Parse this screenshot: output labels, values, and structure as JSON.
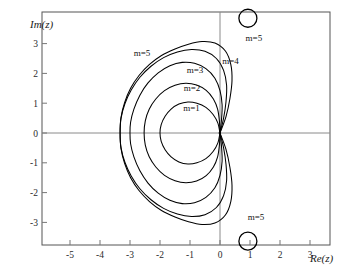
{
  "figure": {
    "title": "",
    "background_color": "#ffffff",
    "curve_color": "#000000",
    "axis_color": "#8a8a8a",
    "frame_color": "#555555"
  },
  "axes": {
    "x_label": "Re(z)",
    "y_label": "Im(z)",
    "x_ticks": [
      "-5",
      "-4",
      "-3",
      "-2",
      "-1",
      "0",
      "1",
      "2",
      "3"
    ],
    "y_ticks": [
      "3",
      "2",
      "1",
      "0",
      "-1",
      "-2",
      "-3"
    ]
  },
  "annotations": {
    "m1": "m=1",
    "m2": "m=2",
    "m3": "m=3",
    "m4": "m=4",
    "m5": "m=5",
    "m5_top_circle": "m=5",
    "m5_bottom_circle": "m=5"
  },
  "chart_data": {
    "type": "line",
    "title": "",
    "xlabel": "Re(z)",
    "ylabel": "Im(z)",
    "xlim": [
      -5.93,
      3.67
    ],
    "ylim": [
      -4.07,
      3.77
    ],
    "grid": false,
    "legend": "inline-labels",
    "x_tick_values": [
      -5,
      -4,
      -3,
      -2,
      -1,
      0,
      1,
      2,
      3
    ],
    "y_tick_values": [
      3,
      2,
      1,
      0,
      -1,
      -2,
      -3
    ],
    "series": [
      {
        "name": "m=1",
        "label": "m=1",
        "label_at": [
          -0.95,
          0.73
        ],
        "closed": true,
        "real_axis_crossings": [
          -2.0,
          0.0
        ],
        "extent_x": [
          -2.0,
          0.03
        ],
        "extent_y": [
          -1.04,
          1.04
        ],
        "points": [
          [
            0.0,
            0.0
          ],
          [
            -0.07,
            0.33
          ],
          [
            -0.23,
            0.62
          ],
          [
            -0.47,
            0.86
          ],
          [
            -0.77,
            1.0
          ],
          [
            -1.07,
            1.04
          ],
          [
            -1.37,
            0.97
          ],
          [
            -1.63,
            0.8
          ],
          [
            -1.83,
            0.56
          ],
          [
            -1.96,
            0.28
          ],
          [
            -2.0,
            0.0
          ],
          [
            -1.96,
            -0.28
          ],
          [
            -1.83,
            -0.56
          ],
          [
            -1.63,
            -0.8
          ],
          [
            -1.37,
            -0.97
          ],
          [
            -1.07,
            -1.04
          ],
          [
            -0.77,
            -1.0
          ],
          [
            -0.47,
            -0.86
          ],
          [
            -0.23,
            -0.62
          ],
          [
            -0.07,
            -0.33
          ],
          [
            0.0,
            0.0
          ]
        ]
      },
      {
        "name": "m=2",
        "label": "m=2",
        "label_at": [
          -0.93,
          1.4
        ],
        "closed": true,
        "real_axis_crossings": [
          -2.53,
          0.0
        ],
        "extent_x": [
          -2.53,
          0.06
        ],
        "extent_y": [
          -1.67,
          1.67
        ],
        "points": [
          [
            0.0,
            0.0
          ],
          [
            -0.02,
            0.4
          ],
          [
            -0.08,
            0.8
          ],
          [
            -0.22,
            1.14
          ],
          [
            -0.46,
            1.43
          ],
          [
            -0.78,
            1.61
          ],
          [
            -1.14,
            1.67
          ],
          [
            -1.5,
            1.6
          ],
          [
            -1.85,
            1.42
          ],
          [
            -2.14,
            1.14
          ],
          [
            -2.36,
            0.8
          ],
          [
            -2.49,
            0.41
          ],
          [
            -2.53,
            0.0
          ],
          [
            -2.49,
            -0.41
          ],
          [
            -2.36,
            -0.8
          ],
          [
            -2.14,
            -1.14
          ],
          [
            -1.85,
            -1.42
          ],
          [
            -1.5,
            -1.6
          ],
          [
            -1.14,
            -1.67
          ],
          [
            -0.78,
            -1.61
          ],
          [
            -0.46,
            -1.43
          ],
          [
            -0.22,
            -1.14
          ],
          [
            -0.08,
            -0.8
          ],
          [
            -0.02,
            -0.4
          ],
          [
            0.0,
            0.0
          ]
        ]
      },
      {
        "name": "m=3",
        "label": "m=3",
        "label_at": [
          -0.83,
          2.0
        ],
        "closed": true,
        "real_axis_crossings": [
          -3.0,
          0.0
        ],
        "extent_x": [
          -3.0,
          0.1
        ],
        "extent_y": [
          -2.37,
          2.37
        ],
        "points": [
          [
            0.0,
            0.0
          ],
          [
            0.05,
            0.45
          ],
          [
            0.07,
            0.95
          ],
          [
            0.0,
            1.42
          ],
          [
            -0.17,
            1.84
          ],
          [
            -0.47,
            2.16
          ],
          [
            -0.85,
            2.34
          ],
          [
            -1.26,
            2.37
          ],
          [
            -1.67,
            2.26
          ],
          [
            -2.06,
            2.02
          ],
          [
            -2.4,
            1.68
          ],
          [
            -2.67,
            1.27
          ],
          [
            -2.87,
            0.8
          ],
          [
            -2.98,
            0.36
          ],
          [
            -3.0,
            0.0
          ],
          [
            -2.98,
            -0.36
          ],
          [
            -2.87,
            -0.8
          ],
          [
            -2.67,
            -1.27
          ],
          [
            -2.4,
            -1.68
          ],
          [
            -2.06,
            -2.02
          ],
          [
            -1.67,
            -2.26
          ],
          [
            -1.26,
            -2.37
          ],
          [
            -0.85,
            -2.34
          ],
          [
            -0.47,
            -2.16
          ],
          [
            -0.17,
            -1.84
          ],
          [
            0.0,
            -1.42
          ],
          [
            0.07,
            -0.95
          ],
          [
            0.05,
            -0.45
          ],
          [
            0.0,
            0.0
          ]
        ]
      },
      {
        "name": "m=4",
        "label": "m=4",
        "label_at": [
          0.35,
          2.3
        ],
        "closed": true,
        "real_axis_crossings": [
          -3.33,
          0.0
        ],
        "extent_x": [
          -3.33,
          0.22
        ],
        "extent_y": [
          -2.8,
          2.8
        ],
        "points": [
          [
            0.0,
            0.0
          ],
          [
            0.12,
            0.5
          ],
          [
            0.2,
            1.05
          ],
          [
            0.22,
            1.6
          ],
          [
            0.12,
            2.1
          ],
          [
            -0.12,
            2.5
          ],
          [
            -0.5,
            2.74
          ],
          [
            -0.95,
            2.8
          ],
          [
            -1.42,
            2.72
          ],
          [
            -1.88,
            2.53
          ],
          [
            -2.3,
            2.24
          ],
          [
            -2.67,
            1.87
          ],
          [
            -2.96,
            1.44
          ],
          [
            -3.17,
            0.98
          ],
          [
            -3.3,
            0.49
          ],
          [
            -3.33,
            0.0
          ],
          [
            -3.3,
            -0.49
          ],
          [
            -3.17,
            -0.98
          ],
          [
            -2.96,
            -1.44
          ],
          [
            -2.67,
            -1.87
          ],
          [
            -2.3,
            -2.24
          ],
          [
            -1.88,
            -2.53
          ],
          [
            -1.42,
            -2.72
          ],
          [
            -0.95,
            -2.8
          ],
          [
            -0.5,
            -2.74
          ],
          [
            -0.12,
            -2.5
          ],
          [
            0.12,
            -2.1
          ],
          [
            0.22,
            -1.6
          ],
          [
            0.2,
            -1.05
          ],
          [
            0.12,
            -0.5
          ],
          [
            0.0,
            0.0
          ]
        ]
      },
      {
        "name": "m=5",
        "label": "m=5",
        "label_at": [
          -2.6,
          2.6
        ],
        "closed": true,
        "real_axis_crossings": [
          -3.33,
          0.0
        ],
        "extent_x": [
          -3.33,
          0.4
        ],
        "extent_y": [
          -3.07,
          3.07
        ],
        "points": [
          [
            0.0,
            0.0
          ],
          [
            0.2,
            0.55
          ],
          [
            0.33,
            1.15
          ],
          [
            0.4,
            1.75
          ],
          [
            0.36,
            2.3
          ],
          [
            0.18,
            2.75
          ],
          [
            -0.17,
            3.02
          ],
          [
            -0.6,
            3.07
          ],
          [
            -1.05,
            2.98
          ],
          [
            -1.5,
            2.82
          ],
          [
            -1.95,
            2.6
          ],
          [
            -2.35,
            2.3
          ],
          [
            -2.7,
            1.93
          ],
          [
            -2.98,
            1.5
          ],
          [
            -3.18,
            1.02
          ],
          [
            -3.3,
            0.52
          ],
          [
            -3.33,
            0.0
          ],
          [
            -3.3,
            -0.52
          ],
          [
            -3.18,
            -1.02
          ],
          [
            -2.98,
            -1.5
          ],
          [
            -2.7,
            -1.93
          ],
          [
            -2.35,
            -2.3
          ],
          [
            -1.95,
            -2.6
          ],
          [
            -1.5,
            -2.82
          ],
          [
            -1.05,
            -2.98
          ],
          [
            -0.6,
            -3.07
          ],
          [
            -0.17,
            -3.02
          ],
          [
            0.18,
            -2.75
          ],
          [
            0.36,
            -2.3
          ],
          [
            0.4,
            -1.75
          ],
          [
            0.33,
            -1.15
          ],
          [
            0.2,
            -0.55
          ],
          [
            0.0,
            0.0
          ]
        ]
      }
    ],
    "isolated_circles": [
      {
        "name": "m=5 upper",
        "center": [
          0.93,
          3.85
        ],
        "radius": 0.3,
        "label": "m=5",
        "label_at": [
          1.13,
          3.1
        ]
      },
      {
        "name": "m=5 lower",
        "center": [
          0.93,
          -3.63
        ],
        "radius": 0.3,
        "label": "m=5",
        "label_at": [
          1.2,
          -2.93
        ]
      }
    ]
  }
}
